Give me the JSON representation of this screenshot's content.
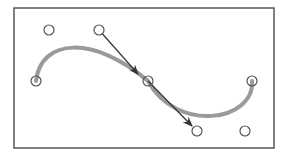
{
  "diagram": {
    "frame": {
      "x": 14,
      "y": 8,
      "width": 260,
      "height": 140,
      "stroke": "#555555"
    },
    "curve": {
      "color": "#9a9a9a",
      "width": 4,
      "anchors": [
        {
          "name": "start-anchor",
          "x": 36,
          "y": 81
        },
        {
          "name": "middle-anchor",
          "x": 148,
          "y": 81
        },
        {
          "name": "end-anchor",
          "x": 252,
          "y": 81
        }
      ],
      "control_points": [
        {
          "name": "control-point-1",
          "x": 49,
          "y": 30
        },
        {
          "name": "control-point-2",
          "x": 99,
          "y": 30
        },
        {
          "name": "control-point-3",
          "x": 197,
          "y": 131
        },
        {
          "name": "control-point-4",
          "x": 245,
          "y": 131
        }
      ]
    },
    "tangent_arrows": [
      {
        "name": "tangent-arrow-incoming",
        "x1": 99,
        "y1": 30,
        "x2": 138,
        "y2": 74
      },
      {
        "name": "tangent-arrow-outgoing",
        "x1": 148,
        "y1": 81,
        "x2": 192,
        "y2": 126
      }
    ],
    "point_style": {
      "radius": 5,
      "stroke": "#555555",
      "fill": "#ffffff"
    },
    "arrow_color": "#333333"
  }
}
